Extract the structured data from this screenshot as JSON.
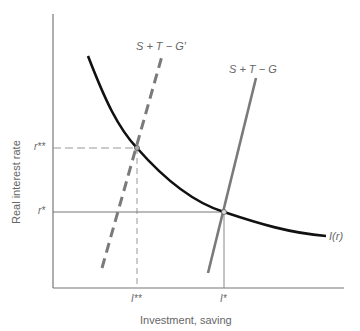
{
  "diagram": {
    "type": "economics-saving-investment",
    "axes": {
      "y_label": "Real interest rate",
      "x_label": "Investment, saving",
      "y_ticks": [
        {
          "label": "r**",
          "y": 148
        },
        {
          "label": "r*",
          "y": 212
        }
      ],
      "x_ticks": [
        {
          "label": "I**",
          "x": 137
        },
        {
          "label": "I*",
          "x": 224
        }
      ]
    },
    "curves": [
      {
        "name": "investment-curve",
        "label": "I(r)",
        "style": "solid-black"
      },
      {
        "name": "saving-curve-original",
        "label": "S + T − G",
        "style": "solid-gray"
      },
      {
        "name": "saving-curve-shifted",
        "label": "S + T − G′",
        "style": "dashed-gray"
      }
    ],
    "equilibria": [
      {
        "name": "original",
        "r": "r*",
        "I": "I*"
      },
      {
        "name": "new",
        "r": "r**",
        "I": "I**"
      }
    ],
    "colors": {
      "investment": "#111111",
      "saving": "#7a7a7a",
      "axis": "#777777",
      "guide": "#888888",
      "text": "#666666"
    }
  }
}
